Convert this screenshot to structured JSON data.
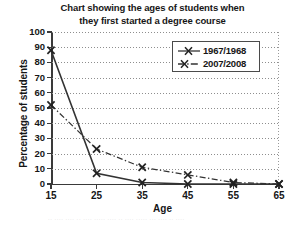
{
  "chart_data": {
    "type": "line",
    "title": "Chart showing the ages of students when they first started a degree course",
    "title_lines": [
      "Chart showing the ages of students when",
      "they first started a degree course"
    ],
    "xlabel": "Age",
    "ylabel": "Percentage of students",
    "x": [
      15,
      25,
      35,
      45,
      55,
      65
    ],
    "xticklabels": [
      "15",
      "25",
      "35",
      "45",
      "55",
      "65"
    ],
    "yticks": [
      0,
      10,
      20,
      30,
      40,
      50,
      60,
      70,
      80,
      90,
      100
    ],
    "yticklabels": [
      "0",
      "10",
      "20",
      "30",
      "40",
      "50",
      "60",
      "70",
      "80",
      "90",
      "100"
    ],
    "xlim": [
      15,
      65
    ],
    "ylim": [
      0,
      100
    ],
    "grid": true,
    "grid_style": "dotted-horizontal",
    "legend_position": "upper right inside plot",
    "series": [
      {
        "name": "1967/1968",
        "values": [
          88,
          7,
          1,
          0,
          0,
          0
        ],
        "linestyle": "solid",
        "marker": "x",
        "color": "#333333"
      },
      {
        "name": "2007/2008",
        "values": [
          52,
          23,
          11,
          6,
          1,
          0
        ],
        "linestyle": "dash-dot",
        "marker": "x",
        "color": "#333333"
      }
    ]
  },
  "legend": {
    "entries": [
      {
        "label": "1967/1968"
      },
      {
        "label": "2007/2008"
      }
    ]
  },
  "artifact": {
    "bottom_text": "·· ···· ···· ·· ···· ····· ···· ·· ···· ····· ··· ···· ·· ····"
  },
  "colors": {
    "ink": "#161616",
    "axis": "#3a3a3a",
    "grid": "#8e8e8e",
    "series": "#333333",
    "background": "#ffffff"
  }
}
